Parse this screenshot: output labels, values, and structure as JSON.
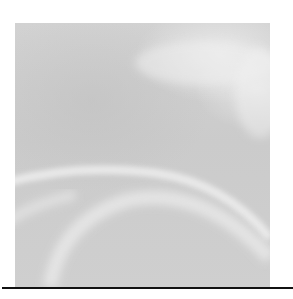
{
  "image": {
    "kind": "abstract-graphic",
    "description": "Grayscale square with light curved swoosh highlights",
    "colors": {
      "background": "#ffffff",
      "panel": "#cdcdcd",
      "highlight": "#eeeeee",
      "rule": "#111111"
    }
  }
}
